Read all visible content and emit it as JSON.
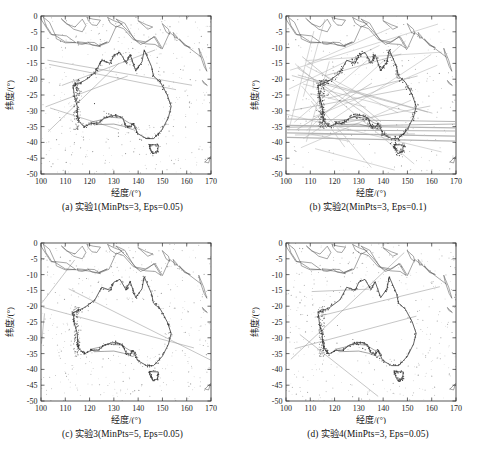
{
  "figure": {
    "panel_count": 4
  },
  "axes": {
    "xlabel": "经度/(°)",
    "ylabel": "纬度/(°)",
    "xticks": [
      "100",
      "110",
      "120",
      "130",
      "140",
      "150",
      "160",
      "170"
    ],
    "yticks": [
      "0",
      "-5",
      "-10",
      "-15",
      "-20",
      "-25",
      "-30",
      "-35",
      "-40",
      "-45",
      "-50"
    ],
    "xlim": [
      100,
      170
    ],
    "ylim": [
      -50,
      0
    ]
  },
  "panels": [
    {
      "id": "a",
      "caption": "(a) 实验1(MinPts=3, Eps=0.05)",
      "experiment": "实验1",
      "min_pts": 3,
      "eps": 0.05,
      "density": "sparse"
    },
    {
      "id": "b",
      "caption": "(b) 实验2(MinPts=3, Eps=0.1)",
      "experiment": "实验2",
      "min_pts": 3,
      "eps": 0.1,
      "density": "dense-lines"
    },
    {
      "id": "c",
      "caption": "(c) 实验3(MinPts=5, Eps=0.05)",
      "experiment": "实验3",
      "min_pts": 5,
      "eps": 0.05,
      "density": "sparse"
    },
    {
      "id": "d",
      "caption": "(d) 实验4(MinPts=3, Eps=0.05)",
      "experiment": "实验4",
      "min_pts": 3,
      "eps": 0.05,
      "density": "sparse"
    }
  ],
  "colors": {
    "axis": "#2b2b2b",
    "coastline": "#5a5a5a",
    "coastline_dark": "#2e2e2e",
    "trajectory": "#8d8d8d",
    "trajectory_light": "#b4b4b4",
    "noise_point": "#9a9a9a",
    "cluster_point": "#3a3a3a",
    "background": "#ffffff"
  },
  "chart_data": {
    "type": "scatter",
    "title": "",
    "xlabel": "经度/(°)",
    "ylabel": "纬度/(°)",
    "xlim": [
      100,
      170
    ],
    "ylim": [
      -50,
      0
    ],
    "xticks": [
      100,
      110,
      120,
      130,
      140,
      150,
      160,
      170
    ],
    "yticks": [
      0,
      -5,
      -10,
      -15,
      -20,
      -25,
      -30,
      -35,
      -40,
      -45,
      -50
    ],
    "grid": false,
    "legend": "none",
    "subplots": [
      {
        "panel": "a",
        "label": "(a) 实验1(MinPts=3, Eps=0.05)",
        "params": {
          "MinPts": 3,
          "Eps": 0.05
        },
        "series": [
          {
            "name": "coastline-australia",
            "type": "line",
            "points": [
              [
                113.2,
                -22.0
              ],
              [
                113.8,
                -25.6
              ],
              [
                114.9,
                -28.5
              ],
              [
                115.1,
                -31.5
              ],
              [
                115.6,
                -33.3
              ],
              [
                117.8,
                -35.1
              ],
              [
                120.5,
                -34.0
              ],
              [
                123.6,
                -33.9
              ],
              [
                126.1,
                -32.3
              ],
              [
                129.0,
                -31.6
              ],
              [
                131.2,
                -31.5
              ],
              [
                133.6,
                -32.2
              ],
              [
                135.0,
                -34.8
              ],
              [
                136.8,
                -35.2
              ],
              [
                138.0,
                -34.0
              ],
              [
                139.8,
                -37.2
              ],
              [
                143.5,
                -38.8
              ],
              [
                146.3,
                -38.8
              ],
              [
                148.0,
                -37.5
              ],
              [
                150.0,
                -35.8
              ],
              [
                152.5,
                -32.0
              ],
              [
                153.6,
                -28.6
              ],
              [
                152.0,
                -25.0
              ],
              [
                149.2,
                -21.0
              ],
              [
                146.3,
                -19.0
              ],
              [
                145.5,
                -16.0
              ],
              [
                142.5,
                -10.7
              ],
              [
                141.6,
                -14.5
              ],
              [
                139.0,
                -17.3
              ],
              [
                136.7,
                -12.2
              ],
              [
                135.0,
                -14.8
              ],
              [
                132.5,
                -11.5
              ],
              [
                130.0,
                -12.4
              ],
              [
                128.5,
                -15.0
              ],
              [
                125.0,
                -14.0
              ],
              [
                122.2,
                -18.0
              ],
              [
                118.0,
                -20.4
              ],
              [
                114.9,
                -21.5
              ],
              [
                113.2,
                -22.0
              ]
            ]
          },
          {
            "name": "coastline-tasmania",
            "type": "line",
            "points": [
              [
                144.6,
                -40.7
              ],
              [
                148.3,
                -40.8
              ],
              [
                148.0,
                -43.0
              ],
              [
                146.0,
                -43.6
              ],
              [
                144.8,
                -41.5
              ],
              [
                144.6,
                -40.7
              ]
            ]
          },
          {
            "name": "coastline-indonesia-png",
            "type": "line",
            "points": [
              [
                100.0,
                -1.0
              ],
              [
                104.0,
                -5.8
              ],
              [
                106.0,
                -6.2
              ],
              [
                110.0,
                -8.2
              ],
              [
                115.0,
                -8.5
              ],
              [
                119.0,
                -8.8
              ],
              [
                124.0,
                -9.5
              ],
              [
                128.0,
                -8.3
              ],
              [
                131.0,
                -3.2
              ],
              [
                134.0,
                -4.0
              ],
              [
                138.0,
                -7.5
              ],
              [
                143.0,
                -8.2
              ],
              [
                147.0,
                -6.5
              ],
              [
                150.0,
                -10.3
              ],
              [
                153.0,
                -5.2
              ],
              [
                156.0,
                -7.0
              ],
              [
                160.0,
                -9.5
              ],
              [
                166.0,
                -13.0
              ]
            ]
          },
          {
            "name": "noise-points",
            "type": "scatter",
            "count": 420,
            "distribution": "scattered over ocean regions, densest near coastal corridors"
          },
          {
            "name": "cluster-points",
            "type": "scatter",
            "count": 310,
            "distribution": "dense along western and southeastern Australian coast"
          },
          {
            "name": "trajectory-lines",
            "type": "line",
            "count": 6,
            "description": "long straight shipping lanes radiating from SW coast"
          }
        ]
      },
      {
        "panel": "b",
        "label": "(b) 实验2(MinPts=3, Eps=0.1)",
        "params": {
          "MinPts": 3,
          "Eps": 0.1
        },
        "series": [
          {
            "name": "trajectory-lines",
            "type": "line",
            "count": 22,
            "description": "many merged long shipping lanes crossing the whole domain"
          },
          {
            "name": "cluster-points",
            "type": "scatter",
            "count": 480,
            "distribution": "thick bands along west coast and across southern bight"
          },
          {
            "name": "noise-points",
            "type": "scatter",
            "count": 260
          }
        ]
      },
      {
        "panel": "c",
        "label": "(c) 实验3(MinPts=5, Eps=0.05)",
        "params": {
          "MinPts": 5,
          "Eps": 0.05
        },
        "series": [
          {
            "name": "cluster-points",
            "type": "scatter",
            "count": 280,
            "distribution": "fewer clusters, concentrated on west and southeast coast"
          },
          {
            "name": "noise-points",
            "type": "scatter",
            "count": 450
          },
          {
            "name": "trajectory-lines",
            "type": "line",
            "count": 4
          }
        ]
      },
      {
        "panel": "d",
        "label": "(d) 实验4(MinPts=3, Eps=0.05)",
        "params": {
          "MinPts": 3,
          "Eps": 0.05
        },
        "series": [
          {
            "name": "cluster-points",
            "type": "scatter",
            "count": 300,
            "distribution": "dense along west coast band near 114E"
          },
          {
            "name": "noise-points",
            "type": "scatter",
            "count": 430
          },
          {
            "name": "trajectory-lines",
            "type": "line",
            "count": 5
          }
        ]
      }
    ]
  }
}
